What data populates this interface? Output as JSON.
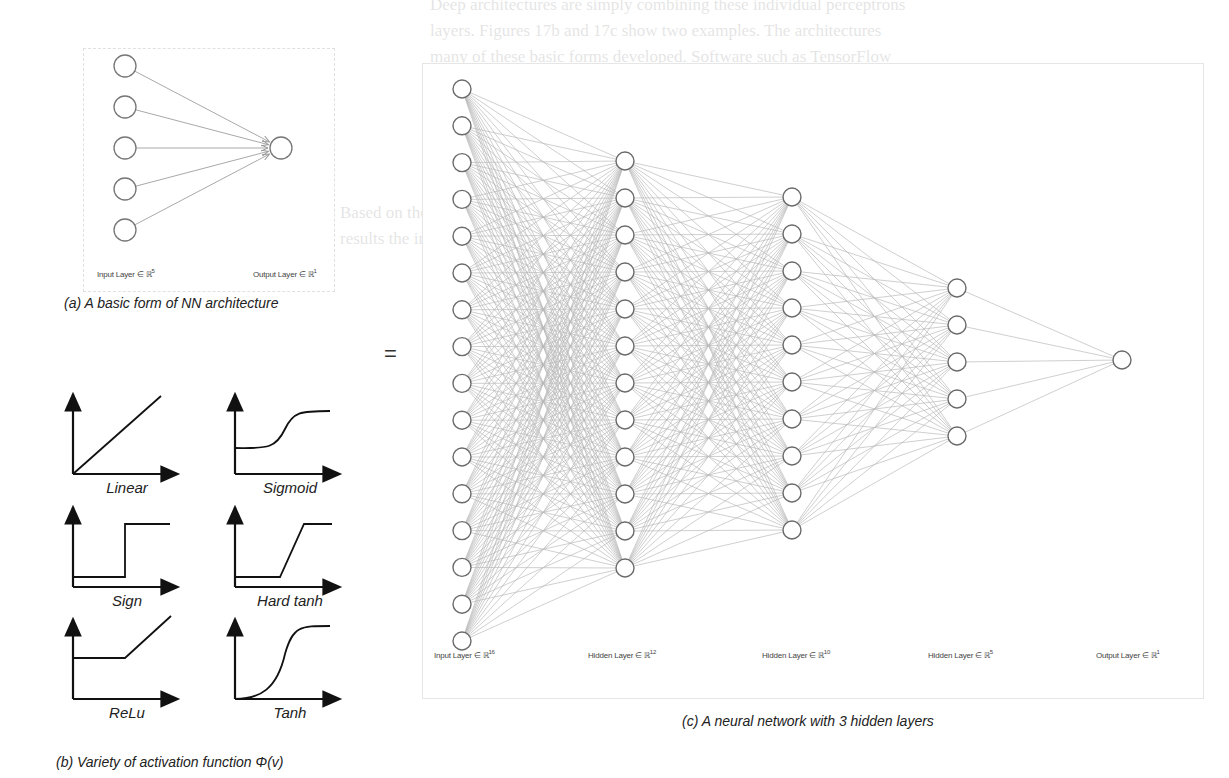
{
  "background_text": {
    "lines": [
      "Deep architectures are simply combining these individual perceptrons",
      "layers. Figures 17b and 17c show two examples. The architectures",
      "many of these basic forms developed. Software such as TensorFlow",
      "build on these ideas but allow users to use graphical interfaces",
      "(GUI) to represent the architecture of their networks to design them",
      "Explained below."
    ],
    "right_fragments": [
      "The activation of layers",
      "available methods as the basis",
      "constant θ. For example, the",
      "Output, which is the first"
    ],
    "left_fragments": [
      "Based on the",
      "results the in"
    ]
  },
  "panel_a": {
    "caption": "(a) A basic form of NN architecture",
    "input_label": "Input Layer ∈ ℝ",
    "input_dim": "5",
    "output_label": "Output Layer ∈ ℝ",
    "output_dim": "1",
    "input_nodes": 5,
    "output_nodes": 1
  },
  "equals_sign": "=",
  "panel_b": {
    "caption": "(b) Variety of activation function Φ(v)",
    "functions": [
      {
        "name": "Linear",
        "shape": "linear"
      },
      {
        "name": "Sigmoid",
        "shape": "sigmoid"
      },
      {
        "name": "Sign",
        "shape": "sign"
      },
      {
        "name": "Hard tanh",
        "shape": "hardtanh"
      },
      {
        "name": "ReLu",
        "shape": "relu"
      },
      {
        "name": "Tanh",
        "shape": "tanh"
      }
    ]
  },
  "panel_c": {
    "caption": "(c) A neural network with 3 hidden layers",
    "layers": [
      {
        "label": "Input Layer ∈ ℝ",
        "dim": "16",
        "nodes": 16
      },
      {
        "label": "Hidden Layer ∈ ℝ",
        "dim": "12",
        "nodes": 12
      },
      {
        "label": "Hidden Layer ∈ ℝ",
        "dim": "10",
        "nodes": 10
      },
      {
        "label": "Hidden Layer ∈ ℝ",
        "dim": "5",
        "nodes": 5
      },
      {
        "label": "Output Layer ∈ ℝ",
        "dim": "1",
        "nodes": 1
      }
    ]
  },
  "colors": {
    "edge": "#b8b8b8",
    "node_stroke": "#6a6a6a",
    "axis": "#111111"
  }
}
